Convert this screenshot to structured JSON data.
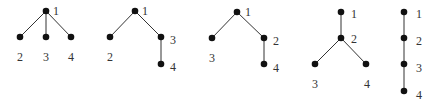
{
  "diagram": {
    "type": "rooted-trees",
    "colors": {
      "node": "#111111",
      "edge": "#333333",
      "label": "#333333",
      "background": "#ffffff"
    },
    "trees": [
      {
        "id": "tree-1",
        "nodes": [
          {
            "label": "1",
            "x": 46,
            "y": 11,
            "lx": 53,
            "ly": 15
          },
          {
            "label": "2",
            "x": 20,
            "y": 37,
            "lx": 17,
            "ly": 61
          },
          {
            "label": "3",
            "x": 46,
            "y": 37,
            "lx": 43,
            "ly": 61
          },
          {
            "label": "4",
            "x": 71,
            "y": 37,
            "lx": 68,
            "ly": 61
          }
        ],
        "edges": [
          [
            "1",
            "2"
          ],
          [
            "1",
            "3"
          ],
          [
            "1",
            "4"
          ]
        ]
      },
      {
        "id": "tree-2",
        "nodes": [
          {
            "label": "1",
            "x": 135,
            "y": 11,
            "lx": 142,
            "ly": 15
          },
          {
            "label": "2",
            "x": 110,
            "y": 37,
            "lx": 107,
            "ly": 61
          },
          {
            "label": "3",
            "x": 161,
            "y": 37,
            "lx": 170,
            "ly": 44
          },
          {
            "label": "4",
            "x": 161,
            "y": 64,
            "lx": 170,
            "ly": 71
          }
        ],
        "edges": [
          [
            "1",
            "2"
          ],
          [
            "1",
            "3"
          ],
          [
            "3",
            "4"
          ]
        ]
      },
      {
        "id": "tree-3",
        "nodes": [
          {
            "label": "1",
            "x": 237,
            "y": 12,
            "lx": 245,
            "ly": 16
          },
          {
            "label": "3",
            "x": 212,
            "y": 38,
            "lx": 209,
            "ly": 62
          },
          {
            "label": "2",
            "x": 264,
            "y": 38,
            "lx": 273,
            "ly": 45
          },
          {
            "label": "4",
            "x": 264,
            "y": 64,
            "lx": 273,
            "ly": 72
          }
        ],
        "edges": [
          [
            "1",
            "3"
          ],
          [
            "1",
            "2"
          ],
          [
            "2",
            "4"
          ]
        ]
      },
      {
        "id": "tree-4",
        "nodes": [
          {
            "label": "1",
            "x": 341,
            "y": 12,
            "lx": 351,
            "ly": 18
          },
          {
            "label": "2",
            "x": 341,
            "y": 38,
            "lx": 351,
            "ly": 43
          },
          {
            "label": "3",
            "x": 315,
            "y": 64,
            "lx": 312,
            "ly": 88
          },
          {
            "label": "4",
            "x": 366,
            "y": 64,
            "lx": 364,
            "ly": 88
          }
        ],
        "edges": [
          [
            "1",
            "2"
          ],
          [
            "2",
            "3"
          ],
          [
            "2",
            "4"
          ]
        ]
      },
      {
        "id": "tree-5",
        "nodes": [
          {
            "label": "1",
            "x": 404,
            "y": 12,
            "lx": 416,
            "ly": 18
          },
          {
            "label": "2",
            "x": 404,
            "y": 38,
            "lx": 416,
            "ly": 45
          },
          {
            "label": "3",
            "x": 404,
            "y": 64,
            "lx": 416,
            "ly": 72
          },
          {
            "label": "4",
            "x": 404,
            "y": 91,
            "lx": 416,
            "ly": 99
          }
        ],
        "edges": [
          [
            "1",
            "2"
          ],
          [
            "2",
            "3"
          ],
          [
            "3",
            "4"
          ]
        ]
      }
    ]
  }
}
